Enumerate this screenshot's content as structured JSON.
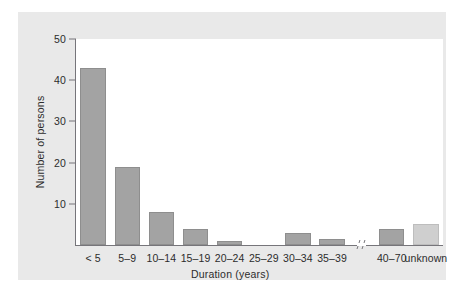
{
  "chart_data": {
    "type": "bar",
    "title": "",
    "subtitle": "",
    "xlabel": "Duration (years)",
    "ylabel": "Number of persons",
    "categories": [
      "< 5",
      "5–9",
      "10–14",
      "15–19",
      "20–24",
      "25–29",
      "30–34",
      "35–39",
      "40–70",
      "unknown"
    ],
    "values": [
      43,
      19,
      8,
      4,
      1,
      0,
      3,
      1.5,
      4,
      5
    ],
    "ylim": [
      0,
      50
    ],
    "yticks": [
      10,
      20,
      30,
      40,
      50
    ],
    "ytick_labels": [
      "10",
      "20",
      "30",
      "40",
      "50"
    ],
    "grid": false,
    "legend": null,
    "annotations": [
      {
        "name": "axis-break",
        "text": "//",
        "description": "x-axis break between the 35–39 and 40–70 categories"
      }
    ],
    "series": [
      {
        "name": "Number of persons",
        "values": [
          43,
          19,
          8,
          4,
          1,
          0,
          3,
          1.5,
          4,
          5
        ]
      }
    ],
    "colors": {
      "bar_fill": "#a3a3a3",
      "bar_edge": "#8e8e8e",
      "bar_fill_unknown": "#cfcfcf",
      "bar_edge_unknown": "#bdbdbd",
      "axis": "#76757a",
      "text": "#2c2c2c",
      "panel_background": "#e9e9e9",
      "plot_background": "#ffffff"
    }
  }
}
